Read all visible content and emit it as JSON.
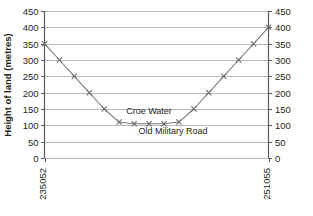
{
  "chart_data": {
    "type": "line",
    "title": "",
    "subtitle": "",
    "xlabel": "",
    "ylabel": "Height of land (metres)",
    "ylim": [
      0,
      450
    ],
    "ytick_step": 50,
    "yticks": [
      0,
      50,
      100,
      150,
      200,
      250,
      300,
      350,
      400,
      450
    ],
    "ytick_labels": [
      "0",
      "50",
      "100",
      "150",
      "200",
      "250",
      "300",
      "350",
      "400",
      "450"
    ],
    "right_axis": true,
    "right_ytick_labels": [
      "0",
      "50",
      "100",
      "150",
      "200",
      "250",
      "300",
      "350",
      "400",
      "450"
    ],
    "grid": true,
    "grid_axis": "y",
    "legend": false,
    "legend_position": "none",
    "marker": "x",
    "x_axis_labels": [
      "235052",
      "251055"
    ],
    "x_axis_label_rotation": -90,
    "x": [
      0,
      1,
      2,
      3,
      4,
      5,
      6,
      7,
      8,
      9,
      10,
      11,
      12,
      13,
      14,
      15
    ],
    "categories": [
      "235052",
      "",
      "",
      "",
      "",
      "",
      "",
      "",
      "",
      "",
      "",
      "",
      "",
      "",
      "",
      "251055"
    ],
    "values": [
      350,
      300,
      250,
      200,
      150,
      110,
      105,
      105,
      105,
      110,
      150,
      200,
      250,
      300,
      350,
      400
    ],
    "series": [
      {
        "name": "Land profile",
        "color": "#7a7a7a",
        "values": [
          350,
          300,
          250,
          200,
          150,
          110,
          105,
          105,
          105,
          110,
          150,
          200,
          250,
          300,
          350,
          400
        ]
      }
    ],
    "annotations": [
      {
        "text": "Croe Water",
        "x": 7,
        "y": 135,
        "position": "above-trough"
      },
      {
        "text": "Old Military Road",
        "x": 8.6,
        "y": 72,
        "position": "below-trough"
      }
    ],
    "colors": {
      "line": "#7a7a7a",
      "marker": "#6e6e6e",
      "grid": "#b9b9b9",
      "axis": "#58595b",
      "text": "#231f20",
      "background": "#ffffff"
    }
  }
}
